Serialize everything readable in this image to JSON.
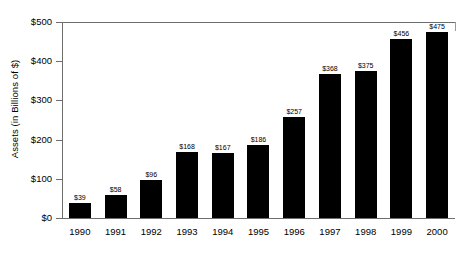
{
  "chart_data": {
    "type": "bar",
    "title": "",
    "xlabel": "",
    "ylabel": "Assets (in Billions of $)",
    "categories": [
      "1990",
      "1991",
      "1992",
      "1993",
      "1994",
      "1995",
      "1996",
      "1997",
      "1998",
      "1999",
      "2000"
    ],
    "values": [
      39,
      58,
      96,
      168,
      167,
      186,
      257,
      368,
      375,
      456,
      475
    ],
    "value_labels": [
      "$39",
      "$58",
      "$96",
      "$168",
      "$167",
      "$186",
      "$257",
      "$368",
      "$375",
      "$456",
      "$475"
    ],
    "ylim": [
      0,
      500
    ],
    "ytick_values": [
      0,
      100,
      200,
      300,
      400,
      500
    ],
    "ytick_labels": [
      "$0",
      "$100",
      "$200",
      "$300",
      "$400",
      "$500"
    ],
    "grid": false,
    "legend": null,
    "bar_color": "#000000",
    "axis_color": "#6e6e6e",
    "background": "#ffffff"
  }
}
